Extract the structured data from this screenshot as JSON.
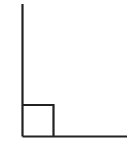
{
  "diagram": {
    "type": "right-angle",
    "stroke_color": "#222222",
    "background": "#ffffff",
    "vertical_ray": {
      "x": 22.5,
      "y1": 4,
      "y2": 136.5
    },
    "horizontal_ray": {
      "y": 136.5,
      "x1": 22.5,
      "x2": 127
    },
    "right_angle_marker": {
      "x": 22.5,
      "y": 105,
      "size": 31.5
    }
  }
}
